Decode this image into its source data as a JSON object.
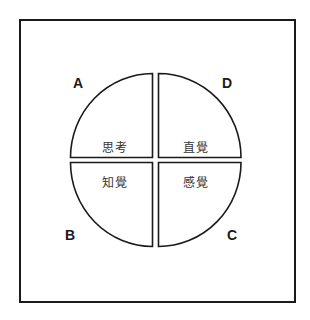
{
  "diagram": {
    "type": "quadrant-circle",
    "quadrants": [
      {
        "position": "top-left",
        "letter": "A",
        "term": "思考"
      },
      {
        "position": "top-right",
        "letter": "D",
        "term": "直覺"
      },
      {
        "position": "bottom-left",
        "letter": "B",
        "term": "知覺"
      },
      {
        "position": "bottom-right",
        "letter": "C",
        "term": "感覺"
      }
    ]
  }
}
